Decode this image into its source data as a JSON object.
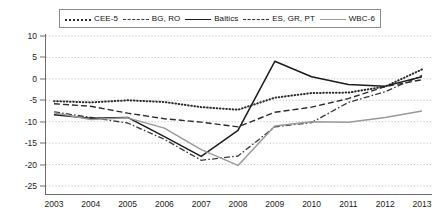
{
  "legend": {
    "position": "top",
    "items": [
      {
        "label": "CEE-5",
        "style": "dotted",
        "color": "#2b2b2b",
        "key": "cee5"
      },
      {
        "label": "BG, RO",
        "style": "dash-dot",
        "color": "#3a3a3a",
        "key": "bgro"
      },
      {
        "label": "Baltics",
        "style": "solid",
        "color": "#1c1c1c",
        "key": "baltics"
      },
      {
        "label": "ES, GR, PT",
        "style": "dashed",
        "color": "#2b2b2b",
        "key": "esgrpt"
      },
      {
        "label": "WBC-6",
        "style": "solid-light",
        "color": "#9a9a9a",
        "key": "wbc6"
      }
    ]
  },
  "axes": {
    "y_ticks": [
      10,
      5,
      0,
      -5,
      -10,
      -15,
      -20,
      -25
    ],
    "y_tick_labels": [
      "10",
      "5",
      "0",
      "-5",
      "-10",
      "-15",
      "-20",
      "-25"
    ],
    "x_tick_labels": [
      "2003",
      "2004",
      "2005",
      "2006",
      "2007",
      "2008",
      "2009",
      "2010",
      "2011",
      "2012",
      "2013"
    ]
  },
  "chart_data": {
    "type": "line",
    "title": "",
    "subtitle": "",
    "xlabel": "",
    "ylabel": "",
    "grid": true,
    "grid_style": "dotted-horizontal",
    "legend_position": "top",
    "xlim": [
      2003,
      2013
    ],
    "ylim": [
      -25,
      10
    ],
    "x": [
      2003,
      2004,
      2005,
      2006,
      2007,
      2008,
      2009,
      2010,
      2011,
      2012,
      2013
    ],
    "categories": [
      "2003",
      "2004",
      "2005",
      "2006",
      "2007",
      "2008",
      "2009",
      "2010",
      "2011",
      "2012",
      "2013"
    ],
    "series": [
      {
        "name": "CEE-5",
        "style": "dotted",
        "color": "#2b2b2b",
        "values": [
          -5.2,
          -5.5,
          -5.0,
          -5.4,
          -6.6,
          -7.2,
          -4.4,
          -3.3,
          -3.2,
          -1.8,
          2.2
        ]
      },
      {
        "name": "BG, RO",
        "style": "dash-dot",
        "color": "#3a3a3a",
        "values": [
          -7.7,
          -9.0,
          -10.3,
          -14.1,
          -19.0,
          -18.0,
          -11.2,
          -10.2,
          -5.5,
          -3.0,
          0.8
        ]
      },
      {
        "name": "Baltics",
        "style": "solid",
        "color": "#1c1c1c",
        "values": [
          -8.4,
          -9.2,
          -9.0,
          -13.5,
          -18.1,
          -12.0,
          4.1,
          0.5,
          -1.3,
          -1.7,
          0.5
        ]
      },
      {
        "name": "ES, GR, PT",
        "style": "dashed",
        "color": "#2b2b2b",
        "values": [
          -5.8,
          -6.4,
          -8.0,
          -9.3,
          -10.1,
          -11.2,
          -7.8,
          -6.6,
          -4.6,
          -1.8,
          -0.2
        ]
      },
      {
        "name": "WBC-6",
        "style": "solid-light",
        "color": "#9a9a9a",
        "values": [
          -7.9,
          -9.5,
          -9.1,
          -11.5,
          -16.5,
          -20.2,
          -11.0,
          -10.0,
          -10.1,
          -9.0,
          -7.5
        ]
      }
    ]
  }
}
